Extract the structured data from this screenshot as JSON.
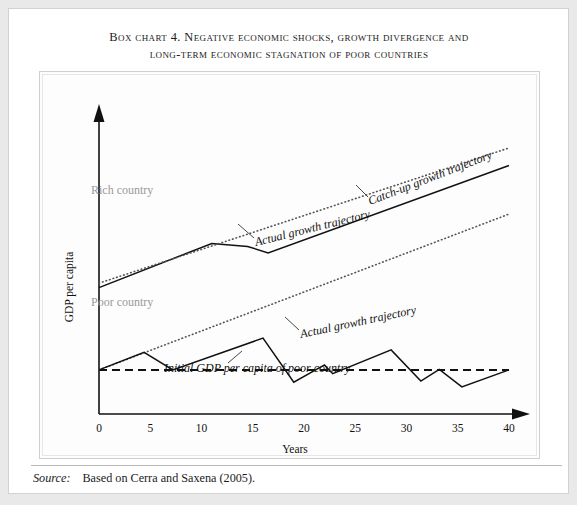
{
  "box": {
    "title_line1": "Box chart 4. Negative economic shocks, growth divergence and",
    "title_line2": "long-term economic stagnation of poor countries",
    "source_label": "Source:",
    "source_text": "Based on Cerra and Saxena (2005)."
  },
  "chart_data": {
    "type": "line",
    "title": "Box chart 4. Negative economic shocks, growth divergence and long-term economic stagnation of poor countries",
    "xlabel": "Years",
    "ylabel": "GDP per capita",
    "xlim": [
      0,
      40
    ],
    "xticks": [
      "0",
      "5",
      "10",
      "15",
      "20",
      "25",
      "30",
      "35",
      "40"
    ],
    "xtick_values": [
      0,
      5,
      10,
      15,
      20,
      25,
      30,
      35,
      40
    ],
    "yticks": [],
    "grid": false,
    "legend": "inline-labels",
    "group_labels": [
      {
        "text": "Rich country",
        "x": 3,
        "y_rel": 0.78,
        "color": "#9a9a9a"
      },
      {
        "text": "Poor country",
        "x": 3,
        "y_rel": 0.4,
        "color": "#9a9a9a"
      }
    ],
    "annotations": [
      {
        "text": "Actual growth trajectory",
        "target": "rich-actual"
      },
      {
        "text": "Catch-up growth trajectory",
        "target": "poor-catchup"
      },
      {
        "text": "Actual growth trajectory",
        "target": "poor-actual"
      },
      {
        "text": "Initial GDP per capita of poor country",
        "target": "baseline"
      }
    ],
    "series": [
      {
        "name": "Rich country actual growth trajectory",
        "style": "solid",
        "x": [
          0,
          11,
          14.5,
          16.5,
          40
        ],
        "y": [
          0.43,
          0.58,
          0.57,
          0.548,
          0.845
        ]
      },
      {
        "name": "Rich country potential (dotted)",
        "style": "dotted",
        "x": [
          0,
          40
        ],
        "y": [
          0.445,
          0.905
        ]
      },
      {
        "name": "Poor country catch-up growth trajectory",
        "style": "dotted",
        "x": [
          0,
          40
        ],
        "y": [
          0.15,
          0.68
        ]
      },
      {
        "name": "Poor country actual growth trajectory",
        "style": "solid",
        "x": [
          0,
          4.4,
          7.2,
          16,
          19,
          22,
          22.8,
          28.5,
          31.4,
          33.2,
          35.4,
          40
        ],
        "y": [
          0.15,
          0.21,
          0.15,
          0.258,
          0.108,
          0.167,
          0.137,
          0.218,
          0.112,
          0.152,
          0.092,
          0.15
        ]
      },
      {
        "name": "Initial GDP per capita of poor country (baseline)",
        "style": "dashed",
        "x": [
          0,
          40
        ],
        "y": [
          0.15,
          0.15
        ]
      }
    ]
  }
}
